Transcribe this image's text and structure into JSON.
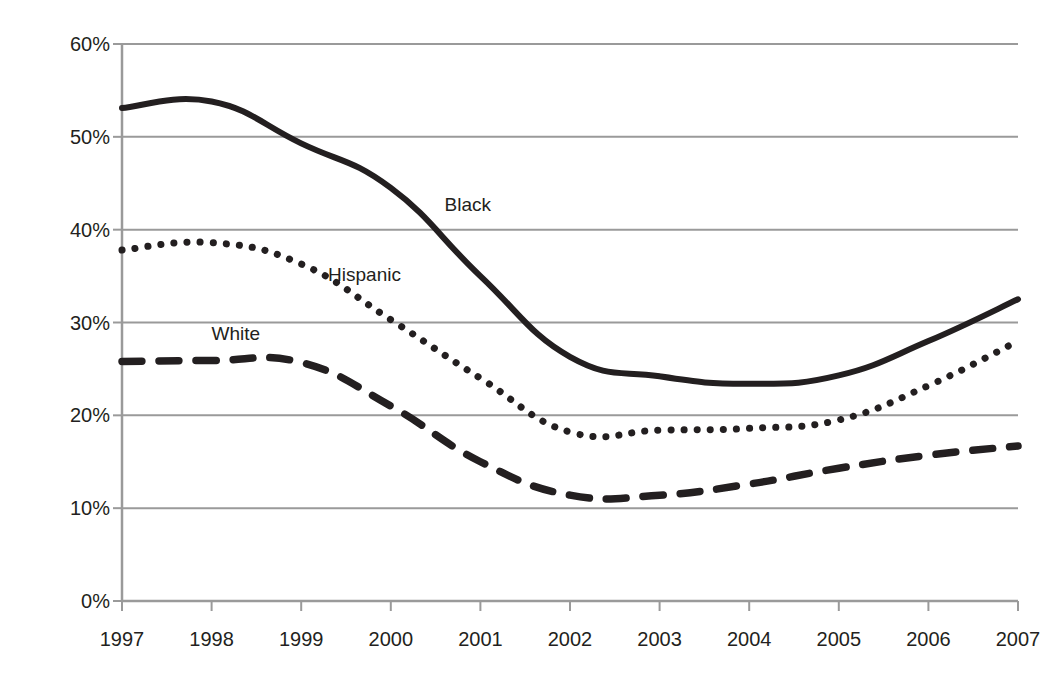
{
  "chart_data": {
    "type": "line",
    "title": "",
    "subtitle": "",
    "xlabel": "",
    "ylabel": "Denial Rates",
    "categories": [
      "1997",
      "1998",
      "1999",
      "2000",
      "2001",
      "2002",
      "2003",
      "2004",
      "2005",
      "2006",
      "2007"
    ],
    "x": [
      1997,
      1998,
      1999,
      2000,
      2001,
      2002,
      2003,
      2004,
      2005,
      2006,
      2007
    ],
    "xlim": [
      1997,
      2007
    ],
    "ylim": [
      0,
      60
    ],
    "ytick_labels": [
      "0%",
      "10%",
      "20%",
      "30%",
      "40%",
      "50%",
      "60%"
    ],
    "ytick_values": [
      0,
      10,
      20,
      30,
      40,
      50,
      60
    ],
    "grid": "horizontal",
    "legend": "inline-labels",
    "value_suffix": "%",
    "series": [
      {
        "name": "Black",
        "style": "solid",
        "color": "#231f20",
        "label_x": 2000.6,
        "label_y": 42.5,
        "values": [
          53.1,
          53.8,
          49.3,
          44.5,
          35.0,
          26.3,
          24.2,
          23.4,
          24.3,
          28.0,
          32.5
        ]
      },
      {
        "name": "Hispanic",
        "style": "dotted",
        "color": "#231f20",
        "label_x": 1999.3,
        "label_y": 35.0,
        "values": [
          37.8,
          38.6,
          36.3,
          30.3,
          24.0,
          18.2,
          18.4,
          18.6,
          19.5,
          23.2,
          28.0
        ]
      },
      {
        "name": "White",
        "style": "dashed",
        "color": "#231f20",
        "label_x": 1998.0,
        "label_y": 28.6,
        "values": [
          25.8,
          25.9,
          25.7,
          21.0,
          15.0,
          11.4,
          11.4,
          12.6,
          14.3,
          15.7,
          16.7
        ]
      }
    ],
    "axis_color": "#9a9a9a",
    "grid_color": "#9a9a9a",
    "background": "#ffffff"
  }
}
